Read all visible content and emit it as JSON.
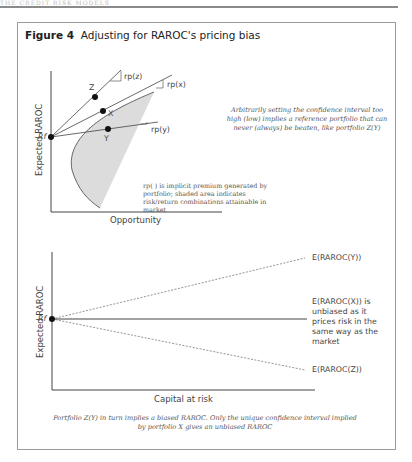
{
  "header": {
    "running_head": "THE CREDIT RISK MODELS"
  },
  "figure": {
    "number_label": "Figure 4",
    "title": "Adjusting for RAROC's pricing bias"
  },
  "top_panel": {
    "y_axis_label": "Expected RAROC",
    "x_axis_label": "Opportunity",
    "origin_label": "Rf",
    "points": [
      {
        "name": "Z",
        "line_label": "rp(z)"
      },
      {
        "name": "X",
        "line_label": "rp(x)"
      },
      {
        "name": "Y",
        "line_label": "rp(y)"
      }
    ],
    "annotation": "Arbitrarily setting the confidence interval too high (low) implies a reference portfolio that can never (always) be beaten, like portfolio Z(Y)",
    "legend_note": "rp( ) is implicit premium generated by portfolio; shaded area indicates risk/return combinations attainable in market"
  },
  "bottom_panel": {
    "y_axis_label": "Expected RAROC",
    "x_axis_label": "Capital at risk",
    "origin_label": "Rf",
    "lines": [
      {
        "label": "E(RAROC(Y))",
        "style": "dotted",
        "direction": "up"
      },
      {
        "label": "E(RAROC(X)) is unbiased as it prices risk in the same way as the market",
        "style": "solid",
        "direction": "flat"
      },
      {
        "label": "E(RAROC(Z))",
        "style": "dotted",
        "direction": "down"
      }
    ]
  },
  "caption": "Portfolio Z(Y) in turn implies a biased RAROC. Only the unique confidence interval implied by portfolio X gives an unbiased RAROC",
  "colors": {
    "shade": "#dcdcdc",
    "line": "#444444",
    "border": "#9a9a9a"
  }
}
